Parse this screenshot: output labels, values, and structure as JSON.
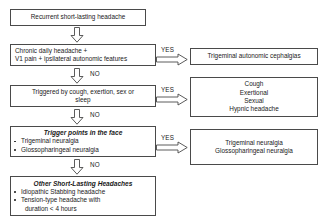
{
  "diagram": {
    "line_color": "#4a4a4a",
    "text_color": "#1a1a1a",
    "background": "#ffffff"
  },
  "decision_column": {
    "start_box": {
      "lines": [
        "Recurrent short-lasting headache"
      ]
    },
    "step1": {
      "lines": [
        "Chronic daily headache +",
        "V1 pain + ipsilateral autonomic features"
      ]
    },
    "step2": {
      "lines": [
        "Triggered by cough, exertion, sex or",
        "sleep"
      ]
    },
    "step3": {
      "heading": "Trigger points in the face",
      "bullets": [
        "Trigeminal neuralgia",
        "Glossopharingeal neuralgia"
      ]
    },
    "step4": {
      "heading": "Other Short-Lasting Headaches",
      "bullets": [
        "Idiopathic Stabbing headache",
        "Tension-type headache with"
      ],
      "bullet_continuation": "duration < 4 hours"
    }
  },
  "outcome_column": {
    "outcome1": {
      "lines": [
        "Trigeminal autonomic cephalgias"
      ]
    },
    "outcome2": {
      "lines": [
        "Cough",
        "Exertional",
        "Sexual",
        "Hypnic headache"
      ]
    },
    "outcome3": {
      "lines": [
        "Trigeminal neuralgia",
        "Glossopharingeal neuralgia"
      ]
    }
  },
  "edge_labels": {
    "yes_1": "YES",
    "yes_2": "YES",
    "yes_3": "YES",
    "no_1": "NO",
    "no_2": "NO",
    "no_3": "NO"
  }
}
